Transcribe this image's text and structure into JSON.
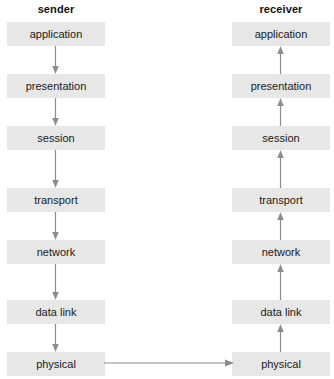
{
  "diagram": {
    "title_sender": "sender",
    "title_receiver": "receiver",
    "background_color": "#ffffff",
    "box_fill_color": "#e7e7e7",
    "text_color": "#1a1a1a",
    "arrow_color": "#808080",
    "columns": [
      {
        "id": "sender",
        "header": "sender",
        "flow_direction": "downward",
        "layers": [
          {
            "label": "application"
          },
          {
            "label": "presentation"
          },
          {
            "label": "session"
          },
          {
            "label": "transport"
          },
          {
            "label": "network"
          },
          {
            "label": "data link"
          },
          {
            "label": "physical"
          }
        ]
      },
      {
        "id": "receiver",
        "header": "receiver",
        "flow_direction": "upward",
        "layers": [
          {
            "label": "application"
          },
          {
            "label": "presentation"
          },
          {
            "label": "session"
          },
          {
            "label": "transport"
          },
          {
            "label": "network"
          },
          {
            "label": "data link"
          },
          {
            "label": "physical"
          }
        ]
      }
    ],
    "link": {
      "from": "physical",
      "to": "physical",
      "direction": "left-to-right"
    }
  }
}
